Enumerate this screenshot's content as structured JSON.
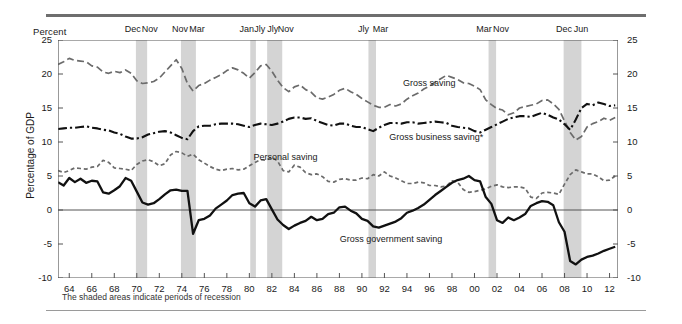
{
  "figure": {
    "unit_header": "Percent",
    "ylabel": "Percentage of GDP",
    "footnote": "The shaded areas indicate periods of recession"
  },
  "chart_data": {
    "type": "line",
    "title": "",
    "xlabel": "",
    "ylabel": "Percentage of GDP",
    "unit_header": "Percent",
    "xlim": [
      1963.0,
      2012.75
    ],
    "ylim": [
      -10,
      25
    ],
    "yticks": [
      -10,
      -5,
      0,
      5,
      10,
      15,
      20,
      25
    ],
    "ytick_labels_left": [
      "-10",
      "-5",
      "0",
      "5",
      "10",
      "15",
      "20",
      "25"
    ],
    "ytick_labels_right": [
      "-10",
      "-5",
      "0",
      "5",
      "10",
      "15",
      "20",
      "25"
    ],
    "xticks": [
      1964,
      1966,
      1968,
      1970,
      1972,
      1974,
      1976,
      1978,
      1980,
      1982,
      1984,
      1986,
      1988,
      1990,
      1992,
      1994,
      1996,
      1998,
      2000,
      2002,
      2004,
      2006,
      2008,
      2010,
      2012
    ],
    "xtick_labels": [
      "64",
      "66",
      "68",
      "70",
      "72",
      "74",
      "76",
      "78",
      "80",
      "82",
      "84",
      "86",
      "88",
      "90",
      "92",
      "94",
      "96",
      "98",
      "00",
      "02",
      "04",
      "06",
      "08",
      "10",
      "12"
    ],
    "grid": false,
    "zero_line": true,
    "legend_position": "inline-annotations",
    "annotations": [
      {
        "text": "Gross saving",
        "x": 1996.0,
        "y": 18.6
      },
      {
        "text": "Personal saving",
        "x": 1983.2,
        "y": 7.6
      },
      {
        "text": "Gross business saving*",
        "x": 1996.6,
        "y": 10.6
      },
      {
        "text": "Gross government saving",
        "x": 1992.6,
        "y": -4.4
      }
    ],
    "recession_bands": [
      {
        "label": "Dec",
        "start": 1969.92,
        "end": 1970.92,
        "peak_label": "Dec",
        "trough_label": "Nov"
      },
      {
        "label": "Nov",
        "start": 1973.92,
        "end": 1975.25,
        "peak_label": "Nov",
        "trough_label": "Mar"
      },
      {
        "label": "Jan",
        "start": 1980.08,
        "end": 1980.58,
        "peak_label": "Jan",
        "trough_label": "Jly"
      },
      {
        "label": "Jly",
        "start": 1981.58,
        "end": 1982.92,
        "peak_label": "Jly",
        "trough_label": "Nov"
      },
      {
        "label": "Jly",
        "start": 1990.58,
        "end": 1991.25,
        "peak_label": "Jly",
        "trough_label": "Mar"
      },
      {
        "label": "Mar",
        "start": 2001.25,
        "end": 2001.92,
        "peak_label": "Mar",
        "trough_label": "Nov"
      },
      {
        "label": "Dec",
        "start": 2007.92,
        "end": 2009.5,
        "peak_label": "Dec",
        "trough_label": "Jun"
      }
    ],
    "recession_band_label_groups": [
      {
        "labels": [
          "Dec",
          "Nov"
        ],
        "center_x": 1970.4
      },
      {
        "labels": [
          "Nov",
          "Mar"
        ],
        "center_x": 1974.6
      },
      {
        "labels": [
          "Jan",
          "Jly",
          "Jly",
          "Nov"
        ],
        "center_x": 1981.5
      },
      {
        "labels": [
          "Jly",
          "Mar"
        ],
        "center_x": 1990.9
      },
      {
        "labels": [
          "Mar",
          "Nov"
        ],
        "center_x": 2001.6
      },
      {
        "labels": [
          "Dec",
          "Jun"
        ],
        "center_x": 2008.7
      }
    ],
    "series": [
      {
        "name": "Gross saving",
        "style": "dashed",
        "color": "#6b6b6b",
        "width": 1.7,
        "x": [
          1963.0,
          1963.5,
          1964.0,
          1964.5,
          1965.0,
          1965.5,
          1966.0,
          1966.5,
          1967.0,
          1967.5,
          1968.0,
          1968.5,
          1969.0,
          1969.5,
          1970.0,
          1970.5,
          1971.0,
          1971.5,
          1972.0,
          1972.5,
          1973.0,
          1973.5,
          1974.0,
          1974.5,
          1975.0,
          1975.5,
          1976.0,
          1976.5,
          1977.0,
          1977.5,
          1978.0,
          1978.5,
          1979.0,
          1979.5,
          1980.0,
          1980.5,
          1981.0,
          1981.5,
          1982.0,
          1982.5,
          1983.0,
          1983.5,
          1984.0,
          1984.5,
          1985.0,
          1985.5,
          1986.0,
          1986.5,
          1987.0,
          1987.5,
          1988.0,
          1988.5,
          1989.0,
          1989.5,
          1990.0,
          1990.5,
          1991.0,
          1991.5,
          1992.0,
          1992.5,
          1993.0,
          1993.5,
          1994.0,
          1994.5,
          1995.0,
          1995.5,
          1996.0,
          1996.5,
          1997.0,
          1997.5,
          1998.0,
          1998.5,
          1999.0,
          1999.5,
          2000.0,
          2000.5,
          2001.0,
          2001.5,
          2002.0,
          2002.5,
          2003.0,
          2003.5,
          2004.0,
          2004.5,
          2005.0,
          2005.5,
          2006.0,
          2006.5,
          2007.0,
          2007.5,
          2008.0,
          2008.5,
          2009.0,
          2009.5,
          2010.0,
          2010.5,
          2011.0,
          2011.5,
          2012.0,
          2012.5
        ],
        "values": [
          21.4,
          21.8,
          22.3,
          22.0,
          21.9,
          21.8,
          21.2,
          21.0,
          20.3,
          20.1,
          20.4,
          20.2,
          20.6,
          20.1,
          19.0,
          18.6,
          18.7,
          18.9,
          19.4,
          20.3,
          21.2,
          22.1,
          20.8,
          18.6,
          17.5,
          18.3,
          18.6,
          19.1,
          19.5,
          19.9,
          20.5,
          20.9,
          20.6,
          20.1,
          19.4,
          20.2,
          21.2,
          21.4,
          20.4,
          19.1,
          18.0,
          17.4,
          18.1,
          18.4,
          17.7,
          17.3,
          16.5,
          16.3,
          16.6,
          17.0,
          17.6,
          17.9,
          17.4,
          17.0,
          16.4,
          15.9,
          15.4,
          15.1,
          15.1,
          15.5,
          15.3,
          15.6,
          16.3,
          16.8,
          17.2,
          17.8,
          18.2,
          18.8,
          19.3,
          19.8,
          19.5,
          19.2,
          18.7,
          18.6,
          18.2,
          17.7,
          16.2,
          15.5,
          14.9,
          14.7,
          14.0,
          14.3,
          15.0,
          15.2,
          15.4,
          15.6,
          16.1,
          16.2,
          15.6,
          14.8,
          13.1,
          11.4,
          10.3,
          10.8,
          12.2,
          12.7,
          13.0,
          13.5,
          13.2,
          13.6
        ]
      },
      {
        "name": "Gross business saving*",
        "style": "dash-dot",
        "color": "#111111",
        "width": 2.1,
        "x": [
          1963.0,
          1963.5,
          1964.0,
          1964.5,
          1965.0,
          1965.5,
          1966.0,
          1966.5,
          1967.0,
          1967.5,
          1968.0,
          1968.5,
          1969.0,
          1969.5,
          1970.0,
          1970.5,
          1971.0,
          1971.5,
          1972.0,
          1972.5,
          1973.0,
          1973.5,
          1974.0,
          1974.5,
          1975.0,
          1975.5,
          1976.0,
          1976.5,
          1977.0,
          1977.5,
          1978.0,
          1978.5,
          1979.0,
          1979.5,
          1980.0,
          1980.5,
          1981.0,
          1981.5,
          1982.0,
          1982.5,
          1983.0,
          1983.5,
          1984.0,
          1984.5,
          1985.0,
          1985.5,
          1986.0,
          1986.5,
          1987.0,
          1987.5,
          1988.0,
          1988.5,
          1989.0,
          1989.5,
          1990.0,
          1990.5,
          1991.0,
          1991.5,
          1992.0,
          1992.5,
          1993.0,
          1993.5,
          1994.0,
          1994.5,
          1995.0,
          1995.5,
          1996.0,
          1996.5,
          1997.0,
          1997.5,
          1998.0,
          1998.5,
          1999.0,
          1999.5,
          2000.0,
          2000.5,
          2001.0,
          2001.5,
          2002.0,
          2002.5,
          2003.0,
          2003.5,
          2004.0,
          2004.5,
          2005.0,
          2005.5,
          2006.0,
          2006.5,
          2007.0,
          2007.5,
          2008.0,
          2008.5,
          2009.0,
          2009.5,
          2010.0,
          2010.5,
          2011.0,
          2011.5,
          2012.0,
          2012.5
        ],
        "values": [
          11.9,
          12.0,
          12.1,
          12.1,
          12.2,
          12.3,
          12.1,
          12.0,
          11.8,
          11.7,
          11.4,
          11.2,
          10.8,
          10.5,
          10.5,
          10.7,
          11.1,
          11.3,
          11.5,
          11.6,
          11.4,
          11.0,
          10.6,
          10.4,
          11.6,
          12.3,
          12.4,
          12.4,
          12.6,
          12.7,
          12.7,
          12.7,
          12.6,
          12.4,
          12.2,
          12.5,
          12.7,
          12.6,
          12.5,
          12.7,
          13.0,
          13.4,
          13.6,
          13.6,
          13.4,
          13.5,
          13.1,
          12.8,
          12.5,
          12.4,
          12.7,
          12.7,
          12.4,
          12.2,
          12.2,
          11.9,
          11.6,
          12.1,
          12.5,
          12.8,
          12.8,
          12.7,
          12.9,
          12.9,
          12.7,
          12.8,
          12.9,
          13.0,
          12.9,
          12.8,
          12.4,
          12.2,
          12.1,
          12.0,
          11.6,
          11.4,
          11.8,
          12.2,
          12.6,
          13.0,
          13.4,
          13.6,
          13.8,
          13.8,
          13.7,
          14.0,
          14.3,
          14.0,
          13.6,
          13.3,
          12.6,
          11.8,
          13.3,
          15.0,
          15.6,
          15.4,
          15.8,
          15.6,
          15.3,
          15.4
        ]
      },
      {
        "name": "Personal saving",
        "style": "short-dashed",
        "color": "#6b6b6b",
        "width": 1.7,
        "x": [
          1963.0,
          1963.5,
          1964.0,
          1964.5,
          1965.0,
          1965.5,
          1966.0,
          1966.5,
          1967.0,
          1967.5,
          1968.0,
          1968.5,
          1969.0,
          1969.5,
          1970.0,
          1970.5,
          1971.0,
          1971.5,
          1972.0,
          1972.5,
          1973.0,
          1973.5,
          1974.0,
          1974.5,
          1975.0,
          1975.5,
          1976.0,
          1976.5,
          1977.0,
          1977.5,
          1978.0,
          1978.5,
          1979.0,
          1979.5,
          1980.0,
          1980.5,
          1981.0,
          1981.5,
          1982.0,
          1982.5,
          1983.0,
          1983.5,
          1984.0,
          1984.5,
          1985.0,
          1985.5,
          1986.0,
          1986.5,
          1987.0,
          1987.5,
          1988.0,
          1988.5,
          1989.0,
          1989.5,
          1990.0,
          1990.5,
          1991.0,
          1991.5,
          1992.0,
          1992.5,
          1993.0,
          1993.5,
          1994.0,
          1994.5,
          1995.0,
          1995.5,
          1996.0,
          1996.5,
          1997.0,
          1997.5,
          1998.0,
          1998.5,
          1999.0,
          1999.5,
          2000.0,
          2000.5,
          2001.0,
          2001.5,
          2002.0,
          2002.5,
          2003.0,
          2003.5,
          2004.0,
          2004.5,
          2005.0,
          2005.5,
          2006.0,
          2006.5,
          2007.0,
          2007.5,
          2008.0,
          2008.5,
          2009.0,
          2009.5,
          2010.0,
          2010.5,
          2011.0,
          2011.5,
          2012.0,
          2012.5
        ],
        "values": [
          5.8,
          5.5,
          5.8,
          6.2,
          6.1,
          6.0,
          6.3,
          6.4,
          7.3,
          7.0,
          6.2,
          6.1,
          6.0,
          5.8,
          6.7,
          7.2,
          7.4,
          7.1,
          6.5,
          6.8,
          8.1,
          8.6,
          8.4,
          7.9,
          8.2,
          7.4,
          6.9,
          6.4,
          6.0,
          5.8,
          6.0,
          6.1,
          5.9,
          6.0,
          6.5,
          7.0,
          7.4,
          7.3,
          7.8,
          7.2,
          5.8,
          5.6,
          6.6,
          6.3,
          5.5,
          5.2,
          5.3,
          4.9,
          4.2,
          4.1,
          4.5,
          4.6,
          4.4,
          4.4,
          4.7,
          4.6,
          5.2,
          5.0,
          5.6,
          5.0,
          4.7,
          4.3,
          3.9,
          3.9,
          4.1,
          4.0,
          3.6,
          3.6,
          3.4,
          3.5,
          4.3,
          4.1,
          3.0,
          2.6,
          2.7,
          2.9,
          3.1,
          3.5,
          3.7,
          3.4,
          3.3,
          3.4,
          3.4,
          3.2,
          1.9,
          1.7,
          2.5,
          2.6,
          2.5,
          2.3,
          3.8,
          5.2,
          5.9,
          5.6,
          5.3,
          5.3,
          4.9,
          4.3,
          4.4,
          5.0
        ]
      },
      {
        "name": "Gross government saving",
        "style": "solid",
        "color": "#111111",
        "width": 2.3,
        "x": [
          1963.0,
          1963.5,
          1964.0,
          1964.5,
          1965.0,
          1965.5,
          1966.0,
          1966.5,
          1967.0,
          1967.5,
          1968.0,
          1968.5,
          1969.0,
          1969.5,
          1970.0,
          1970.5,
          1971.0,
          1971.5,
          1972.0,
          1972.5,
          1973.0,
          1973.5,
          1974.0,
          1974.5,
          1975.0,
          1975.5,
          1976.0,
          1976.5,
          1977.0,
          1977.5,
          1978.0,
          1978.5,
          1979.0,
          1979.5,
          1980.0,
          1980.5,
          1981.0,
          1981.5,
          1982.0,
          1982.5,
          1983.0,
          1983.5,
          1984.0,
          1984.5,
          1985.0,
          1985.5,
          1986.0,
          1986.5,
          1987.0,
          1987.5,
          1988.0,
          1988.5,
          1989.0,
          1989.5,
          1990.0,
          1990.5,
          1991.0,
          1991.5,
          1992.0,
          1992.5,
          1993.0,
          1993.5,
          1994.0,
          1994.5,
          1995.0,
          1995.5,
          1996.0,
          1996.5,
          1997.0,
          1997.5,
          1998.0,
          1998.5,
          1999.0,
          1999.5,
          2000.0,
          2000.5,
          2001.0,
          2001.5,
          2002.0,
          2002.5,
          2003.0,
          2003.5,
          2004.0,
          2004.5,
          2005.0,
          2005.5,
          2006.0,
          2006.5,
          2007.0,
          2007.5,
          2008.0,
          2008.5,
          2009.0,
          2009.5,
          2010.0,
          2010.5,
          2011.0,
          2011.5,
          2012.0,
          2012.5
        ],
        "values": [
          4.1,
          3.6,
          4.7,
          4.1,
          4.6,
          4.0,
          4.3,
          4.2,
          2.6,
          2.4,
          2.9,
          3.5,
          4.7,
          4.3,
          2.7,
          1.1,
          0.8,
          1.0,
          1.6,
          2.3,
          2.9,
          3.0,
          2.8,
          2.8,
          -3.5,
          -1.5,
          -1.3,
          -0.8,
          0.2,
          0.8,
          1.4,
          2.2,
          2.4,
          2.5,
          1.0,
          0.5,
          1.4,
          1.6,
          0.1,
          -1.4,
          -2.2,
          -2.8,
          -2.3,
          -1.9,
          -1.6,
          -1.0,
          -1.5,
          -1.3,
          -0.6,
          -0.4,
          0.4,
          0.5,
          -0.1,
          -0.5,
          -1.3,
          -1.6,
          -2.4,
          -2.6,
          -2.3,
          -2.0,
          -1.7,
          -1.2,
          -0.4,
          -0.1,
          0.3,
          0.8,
          1.5,
          2.2,
          2.8,
          3.4,
          4.0,
          4.4,
          4.6,
          5.0,
          4.4,
          4.2,
          1.9,
          0.9,
          -1.5,
          -1.9,
          -1.1,
          -1.5,
          -1.1,
          -0.6,
          0.6,
          1.0,
          1.3,
          1.2,
          0.7,
          -1.8,
          -3.2,
          -7.5,
          -8.0,
          -7.3,
          -6.9,
          -6.7,
          -6.4,
          -6.0,
          -5.7,
          -5.4
        ]
      }
    ]
  }
}
